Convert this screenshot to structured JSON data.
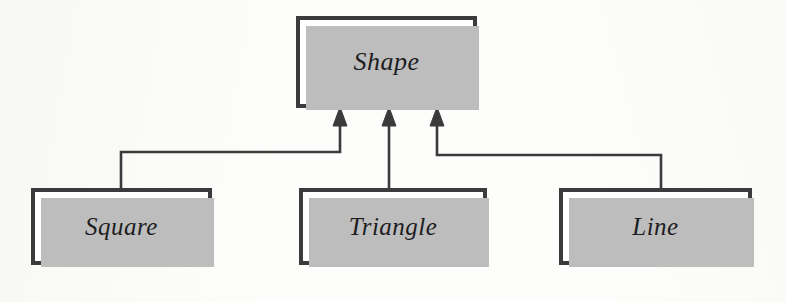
{
  "diagram": {
    "type": "uml-class-diagram",
    "relationship": "generalization",
    "style": {
      "background_color": "#fdfdfb",
      "box_fill": "#ffffff",
      "box_border_color": "#3b3b3d",
      "shadow_color": "#bdbdbd",
      "connector_color": "#3b3b3d",
      "text_color": "#1d1d1f"
    },
    "nodes": [
      {
        "id": "shape",
        "label": "Shape",
        "role": "superclass",
        "x": 296,
        "y": 16,
        "width": 181,
        "height": 92
      },
      {
        "id": "square",
        "label": "Square",
        "role": "subclass",
        "x": 31,
        "y": 188,
        "width": 181,
        "height": 77
      },
      {
        "id": "triangle",
        "label": "Triangle",
        "role": "subclass",
        "x": 299,
        "y": 188,
        "width": 188,
        "height": 77
      },
      {
        "id": "line",
        "label": "Line",
        "role": "subclass",
        "x": 559,
        "y": 188,
        "width": 193,
        "height": 77
      }
    ],
    "edges": [
      {
        "id": "square-to-shape",
        "from": "square",
        "to": "shape",
        "kind": "generalization",
        "arrow": "closed-filled-triangle",
        "arrow_tip_x": 340,
        "arrow_tip_y": 108
      },
      {
        "id": "triangle-to-shape",
        "from": "triangle",
        "to": "shape",
        "kind": "generalization",
        "arrow": "closed-filled-triangle",
        "arrow_tip_x": 389,
        "arrow_tip_y": 108
      },
      {
        "id": "line-to-shape",
        "from": "line",
        "to": "shape",
        "kind": "generalization",
        "arrow": "closed-filled-triangle",
        "arrow_tip_x": 437,
        "arrow_tip_y": 108
      }
    ]
  }
}
